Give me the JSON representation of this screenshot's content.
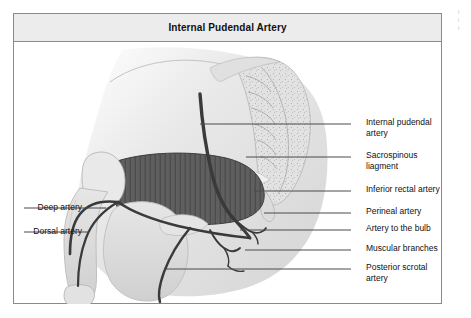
{
  "figure": {
    "title": "Internal Pudendal Artery",
    "background_color": "#ffffff",
    "frame_color": "#8a8a8a",
    "title_bar_color": "#ececec"
  },
  "labels_right": [
    {
      "id": "internal-pudendal-artery",
      "text": "Internal pudendal\nartery",
      "y": 110
    },
    {
      "id": "sacrospinous-liagment",
      "text": "Sacrospinous\nliagment",
      "y": 143
    },
    {
      "id": "inferior-rectal-artery",
      "text": "Inferior rectal artery",
      "y": 177
    },
    {
      "id": "perineal-artery",
      "text": "Perineal artery",
      "y": 199
    },
    {
      "id": "artery-to-the-bulb",
      "text": "Artery to the bulb",
      "y": 216
    },
    {
      "id": "muscular-branches",
      "text": "Muscular branches",
      "y": 236
    },
    {
      "id": "posterior-scrotal-artery",
      "text": "Posterior scrotal\nartery",
      "y": 255
    }
  ],
  "labels_left": [
    {
      "id": "deep-artery",
      "text": "Deep artery",
      "y": 194
    },
    {
      "id": "dorsal-artery",
      "text": "Dorsal artery",
      "y": 218
    }
  ],
  "illustration": {
    "alt": "Sagittal section of the male pelvis and perineum showing the internal pudendal artery and its branches",
    "artery_color": "#3c3c3c",
    "muscle_color": "#5f5f5f",
    "tissue_color": "#dcdcdc",
    "bone_color": "#e4e4e4"
  },
  "margin_note": "I\ni\nr"
}
